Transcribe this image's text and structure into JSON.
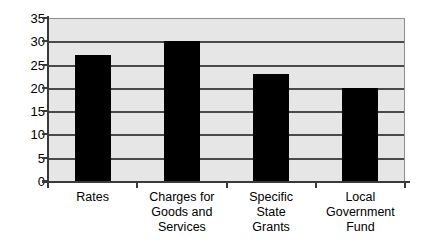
{
  "chart_data": {
    "type": "bar",
    "title": "",
    "subtitle": "",
    "xlabel": "",
    "ylabel": "",
    "categories": [
      "Rates",
      "Charges for Goods and Services",
      "Specific State Grants",
      "Local Government Fund"
    ],
    "category_lines": [
      [
        "Rates"
      ],
      [
        "Charges for",
        "Goods and",
        "Services"
      ],
      [
        "Specific",
        "State",
        "Grants"
      ],
      [
        "Local",
        "Government",
        "Fund"
      ]
    ],
    "values": [
      27,
      30,
      23,
      20
    ],
    "ylim": [
      0,
      35
    ],
    "ytick_step": 5,
    "yticks": [
      35,
      30,
      25,
      20,
      15,
      10,
      5,
      0
    ],
    "grid": true,
    "legend": false,
    "legend_position": "none",
    "colors": {
      "bar": "#000000",
      "plot_background": "#e6e6e6",
      "gridline": "#4a4a4a",
      "axis": "#3a3a3a",
      "text": "#000000",
      "figure_background": "#ffffff"
    }
  }
}
